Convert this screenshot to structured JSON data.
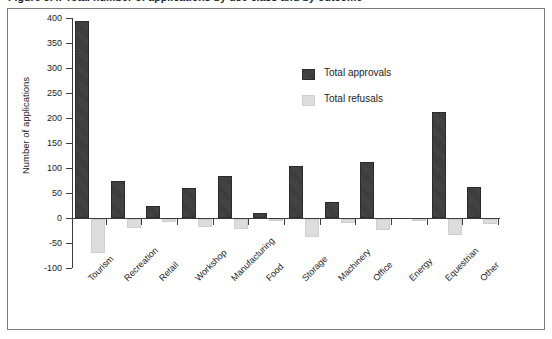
{
  "figure": {
    "caption": "Figure 3.4: Total number of applications by use class and by outcome"
  },
  "legend": {
    "position": "inside-top-right",
    "entries": [
      {
        "label": "Total approvals",
        "color": "#393939",
        "swatch": "approvals-swatch"
      },
      {
        "label": "Total refusals",
        "color": "#dcdcdc",
        "swatch": "refusals-swatch"
      }
    ]
  },
  "axes": {
    "y_label": "Number of applications",
    "y_ticks": [
      "400",
      "350",
      "300",
      "250",
      "200",
      "150",
      "100",
      "50",
      "0",
      "-50",
      "-100"
    ]
  },
  "chart_data": {
    "type": "bar",
    "title": "Figure 3.4: Total number of applications by use class and by outcome",
    "xlabel": "",
    "ylabel": "Number of applications",
    "ylim": [
      -100,
      400
    ],
    "grid": false,
    "legend_position": "inside-top-right",
    "categories": [
      "Tourism",
      "Recreation",
      "Retail",
      "Workshop",
      "Manufacturing",
      "Food",
      "Storage",
      "Machinery",
      "Office",
      "Energy",
      "Equestrian",
      "Other"
    ],
    "series": [
      {
        "name": "Total approvals",
        "color": "#393939",
        "values": [
          395,
          75,
          25,
          60,
          85,
          10,
          105,
          32,
          113,
          0,
          212,
          62
        ]
      },
      {
        "name": "Total refusals",
        "color": "#dcdcdc",
        "values": [
          -68,
          -18,
          -5,
          -15,
          -20,
          -2,
          -35,
          -8,
          -22,
          -1,
          -32,
          -10
        ]
      }
    ]
  }
}
